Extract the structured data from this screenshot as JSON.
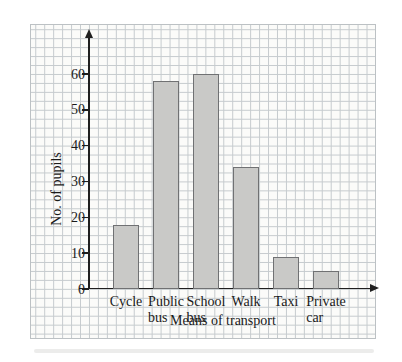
{
  "figure": {
    "page_background": "#ffffff",
    "paper_background": "#fbfbf9",
    "grid_color": "#c6cbce",
    "paper_border_color": "#bcc1c4",
    "axis_color": "#1f1f1f",
    "text_color": "#1a1a1a",
    "bar_fill": "#c9c9c7",
    "bar_border": "#707173"
  },
  "chart_data": {
    "type": "bar",
    "title": "",
    "categories": [
      "Cycle",
      "Public\nbus",
      "School\nbus",
      "Walk",
      "Taxi",
      "Private\ncar"
    ],
    "values": [
      18,
      58,
      60,
      34,
      9,
      5
    ],
    "xlabel": "Means of transport",
    "ylabel": "No. of pupils",
    "yticks": [
      0,
      10,
      20,
      30,
      40,
      50,
      60
    ],
    "ylim": [
      0,
      70
    ],
    "grid": true,
    "legend": false
  }
}
